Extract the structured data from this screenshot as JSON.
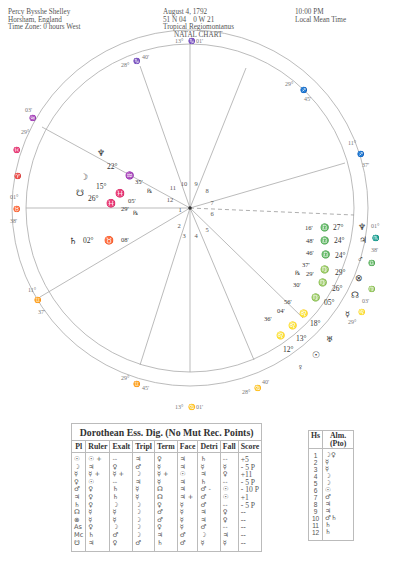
{
  "header": {
    "left": [
      "Percy Bysshe Shelley",
      "Horsham, England",
      "Time Zone: 0 hours West"
    ],
    "middle": [
      "August 4, 1792",
      "51 N 04    0 W 21",
      "Tropical Regiomontanus",
      "NATAL CHART"
    ],
    "right": [
      "10:00 PM",
      "Local Mean Time"
    ]
  },
  "wheel": {
    "house_numbers": [
      "1",
      "2",
      "3",
      "4",
      "5",
      "6",
      "7",
      "8",
      "9",
      "10",
      "11",
      "12"
    ],
    "cusps": [
      {
        "house": "10",
        "deg": "13°",
        "sign": "♑",
        "min": "01'"
      },
      {
        "house": "11",
        "deg": "28°",
        "sign": "♑",
        "min": "40'"
      },
      {
        "house": "12",
        "deg": "29°",
        "sign": "♒",
        "min": "03'"
      },
      {
        "house": "1",
        "deg": "01°",
        "sign": "♈",
        "min": "38'",
        "note": "♉ marker on ring"
      },
      {
        "house": "2",
        "deg": "11°",
        "sign": "♊",
        "min": "37'"
      },
      {
        "house": "3",
        "deg": "29°",
        "sign": "♊",
        "min": "45'"
      },
      {
        "house": "4",
        "deg": "13°",
        "sign": "♋",
        "min": "01'"
      },
      {
        "house": "5",
        "deg": "28°",
        "sign": "♋",
        "min": "40'"
      },
      {
        "house": "6",
        "deg": "29°",
        "sign": "♌",
        "min": "03'"
      },
      {
        "house": "7",
        "deg": "01°",
        "sign": "♏",
        "min": "38'"
      },
      {
        "house": "8",
        "deg": "11°",
        "sign": "♐",
        "min": "37'"
      },
      {
        "house": "9",
        "deg": "29°",
        "sign": "♐",
        "min": "45'"
      }
    ],
    "planets": [
      {
        "glyph": "♆",
        "name": "Neptune (left)",
        "deg": "22°",
        "sign": "♒",
        "min": "35'",
        "retro": "℞"
      },
      {
        "glyph": "☽",
        "name": "Moon",
        "deg": "15°",
        "sign": "♓",
        "min": "05'"
      },
      {
        "glyph": "☋",
        "name": "South Node",
        "deg": "26°",
        "sign": "♓",
        "min": "29'",
        "retro": "℞"
      },
      {
        "glyph": "♄",
        "name": "Saturn",
        "deg": "02°",
        "sign": "♉",
        "min": "08'"
      },
      {
        "glyph": "♆",
        "name": "Neptune",
        "deg": "27°",
        "sign": "♎",
        "min": "16'"
      },
      {
        "glyph": "♃",
        "name": "Jupiter",
        "deg": "24°",
        "sign": "♎",
        "min": "48'"
      },
      {
        "glyph": "♂",
        "name": "Mars",
        "deg": "24°",
        "sign": "♎",
        "min": "46'"
      },
      {
        "glyph": "⊗",
        "name": "Part of Fortune",
        "deg": "29°",
        "sign": "♍",
        "min": "37'",
        "retro": "℞"
      },
      {
        "glyph": "☊",
        "name": "North Node",
        "deg": "26°",
        "sign": "♍",
        "min": "29'"
      },
      {
        "glyph": "☿",
        "name": "Mercury",
        "deg": "05°",
        "sign": "♍",
        "min": "30'"
      },
      {
        "glyph": "♅",
        "name": "Uranus",
        "deg": "18°",
        "sign": "♌",
        "min": "56'"
      },
      {
        "glyph": "☉",
        "name": "Sun",
        "deg": "13°",
        "sign": "♌",
        "min": "04'"
      },
      {
        "glyph": "♀",
        "name": "Venus",
        "deg": "12°",
        "sign": "♌",
        "min": "36'"
      }
    ]
  },
  "dignities": {
    "title": "Dorothean Ess. Dig. (No Mut Rec. Points)",
    "columns": [
      "Pl",
      "Ruler",
      "Exalt",
      "Tripl",
      "Term",
      "Face",
      "Detri",
      "Fall",
      "Score"
    ],
    "rows": [
      {
        "pl": "☉",
        "ruler": "☉ +",
        "exalt": "--",
        "tripl": "♃",
        "term": "♀",
        "face": "♃",
        "detri": "♄",
        "fall": "--",
        "score": "+5"
      },
      {
        "pl": "☽",
        "ruler": "♃",
        "exalt": "♀",
        "tripl": "♂",
        "term": "☿",
        "face": "♃",
        "detri": "☿",
        "fall": "☿",
        "score": "- 5 P"
      },
      {
        "pl": "☿",
        "ruler": "☿ +",
        "exalt": "☿ +",
        "tripl": "☽",
        "term": "☿ +",
        "face": "☉",
        "detri": "♃",
        "fall": "♀",
        "score": "+11"
      },
      {
        "pl": "♀",
        "ruler": "☉",
        "exalt": "--",
        "tripl": "♃",
        "term": "☿",
        "face": "♃",
        "detri": "♄",
        "fall": "--",
        "score": "- 5 P"
      },
      {
        "pl": "♂",
        "ruler": "♀",
        "exalt": "♄",
        "tripl": "☿",
        "term": "☊",
        "face": "♃",
        "detri": "♂ -",
        "fall": "☉",
        "score": "- 10 P"
      },
      {
        "pl": "♃",
        "ruler": "♀",
        "exalt": "♄",
        "tripl": "☿",
        "term": "☊",
        "face": "♃ +",
        "detri": "♂",
        "fall": "☉",
        "score": "+1"
      },
      {
        "pl": "♄",
        "ruler": "♀",
        "exalt": "☽",
        "tripl": "☽",
        "term": "♀",
        "face": "☿",
        "detri": "♂",
        "fall": "--",
        "score": "- 5 P"
      },
      {
        "pl": "☊",
        "ruler": "☿",
        "exalt": "☿",
        "tripl": "☽",
        "term": "♂",
        "face": "☿",
        "detri": "♃",
        "fall": "♀",
        "score": "--"
      },
      {
        "pl": "⊗",
        "ruler": "☿",
        "exalt": "☿",
        "tripl": "☽",
        "term": "♂",
        "face": "☿",
        "detri": "♃",
        "fall": "♀",
        "score": "--"
      },
      {
        "pl": "As",
        "ruler": "♀",
        "exalt": "☽",
        "tripl": "☽",
        "term": "♀",
        "face": "☿",
        "detri": "♂",
        "fall": "--",
        "score": "--"
      },
      {
        "pl": "Mc",
        "ruler": "♄",
        "exalt": "♂",
        "tripl": "☽",
        "term": "♃",
        "face": "♂",
        "detri": "☽",
        "fall": "♃",
        "score": "--"
      },
      {
        "pl": "☋",
        "ruler": "♃",
        "exalt": "♀",
        "tripl": "♂",
        "term": "♄",
        "face": "♂",
        "detri": "☿",
        "fall": "☿",
        "score": "--"
      }
    ]
  },
  "almutens": {
    "columns": [
      "Hs",
      "Alm. (Pto)"
    ],
    "rows": [
      {
        "hs": "1",
        "alm": "☽♀"
      },
      {
        "hs": "2",
        "alm": "☿"
      },
      {
        "hs": "3",
        "alm": "☿"
      },
      {
        "hs": "4",
        "alm": "☽"
      },
      {
        "hs": "5",
        "alm": "☽"
      },
      {
        "hs": "6",
        "alm": "☉"
      },
      {
        "hs": "7",
        "alm": "♂"
      },
      {
        "hs": "8",
        "alm": "♃"
      },
      {
        "hs": "9",
        "alm": "♃"
      },
      {
        "hs": "10",
        "alm": "♂♄"
      },
      {
        "hs": "11",
        "alm": "♄"
      },
      {
        "hs": "12",
        "alm": "♄"
      }
    ]
  }
}
